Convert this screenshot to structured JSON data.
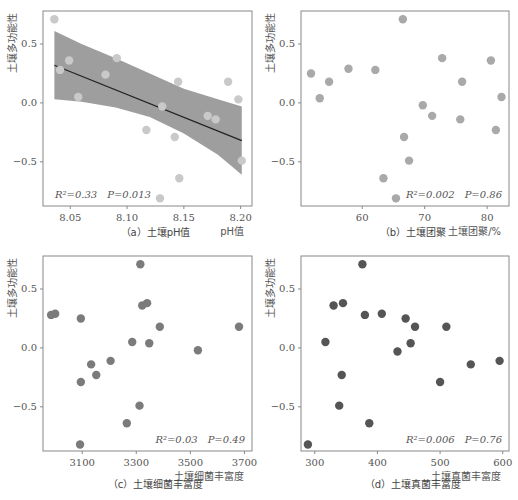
{
  "chart_data": [
    {
      "id": "a",
      "type": "scatter",
      "caption": "（a）土壤pH值",
      "xlabel": "pH值",
      "ylabel": "土壤多功能性",
      "xlim": [
        8.026,
        8.21
      ],
      "ylim": [
        -0.875,
        0.78
      ],
      "xticks": [
        "8.05",
        "8.10",
        "8.15",
        "8.20"
      ],
      "xtick_values": [
        8.05,
        8.1,
        8.15,
        8.2
      ],
      "yticks": [
        "−0.5",
        "0.0",
        "0.5"
      ],
      "ytick_values": [
        -0.5,
        0.0,
        0.5
      ],
      "stats": {
        "r2": "R²=0.33",
        "p": "P=0.013"
      },
      "point_color": "#c9c9c9",
      "regression": {
        "x": [
          8.036,
          8.201
        ],
        "y": [
          0.32,
          -0.32
        ],
        "line_color": "#222222",
        "ci_color": "#999999",
        "ci_upper": [
          [
            8.036,
            0.61
          ],
          [
            8.06,
            0.5
          ],
          [
            8.09,
            0.38
          ],
          [
            8.12,
            0.25
          ],
          [
            8.15,
            0.12
          ],
          [
            8.18,
            0.03
          ],
          [
            8.201,
            -0.03
          ]
        ],
        "ci_lower": [
          [
            8.036,
            0.03
          ],
          [
            8.06,
            0.01
          ],
          [
            8.09,
            -0.04
          ],
          [
            8.12,
            -0.12
          ],
          [
            8.15,
            -0.26
          ],
          [
            8.18,
            -0.44
          ],
          [
            8.201,
            -0.61
          ]
        ]
      },
      "points": [
        {
          "x": 8.036,
          "y": 0.71
        },
        {
          "x": 8.041,
          "y": 0.28
        },
        {
          "x": 8.049,
          "y": 0.36
        },
        {
          "x": 8.057,
          "y": 0.05
        },
        {
          "x": 8.081,
          "y": 0.24
        },
        {
          "x": 8.091,
          "y": 0.38
        },
        {
          "x": 8.117,
          "y": -0.23
        },
        {
          "x": 8.129,
          "y": -0.81
        },
        {
          "x": 8.131,
          "y": -0.03
        },
        {
          "x": 8.142,
          "y": -0.29
        },
        {
          "x": 8.145,
          "y": 0.18
        },
        {
          "x": 8.146,
          "y": -0.64
        },
        {
          "x": 8.171,
          "y": -0.11
        },
        {
          "x": 8.178,
          "y": -0.14
        },
        {
          "x": 8.189,
          "y": 0.18
        },
        {
          "x": 8.198,
          "y": 0.03
        },
        {
          "x": 8.201,
          "y": -0.49
        }
      ]
    },
    {
      "id": "b",
      "type": "scatter",
      "caption": "（b）土壤团聚",
      "xlabel": "土壤团聚/%",
      "ylabel": "土壤多功能性",
      "xlim": [
        50.2,
        83.5
      ],
      "ylim": [
        -0.875,
        0.78
      ],
      "xticks": [
        "60",
        "70",
        "80"
      ],
      "xtick_values": [
        60,
        70,
        80
      ],
      "yticks": [
        "−0.5",
        "0.0",
        "0.5"
      ],
      "ytick_values": [
        -0.5,
        0.0,
        0.5
      ],
      "stats": {
        "r2": "R²=0.002",
        "p": "P=0.86"
      },
      "point_color": "#a9a9a9",
      "points": [
        {
          "x": 51.8,
          "y": 0.25
        },
        {
          "x": 53.2,
          "y": 0.04
        },
        {
          "x": 54.7,
          "y": 0.18
        },
        {
          "x": 57.8,
          "y": 0.29
        },
        {
          "x": 62.1,
          "y": 0.28
        },
        {
          "x": 63.4,
          "y": -0.64
        },
        {
          "x": 65.4,
          "y": -0.81
        },
        {
          "x": 66.5,
          "y": 0.71
        },
        {
          "x": 66.7,
          "y": -0.29
        },
        {
          "x": 67.5,
          "y": -0.49
        },
        {
          "x": 69.7,
          "y": -0.02
        },
        {
          "x": 71.2,
          "y": -0.11
        },
        {
          "x": 72.8,
          "y": 0.38
        },
        {
          "x": 75.7,
          "y": -0.14
        },
        {
          "x": 76.0,
          "y": 0.18
        },
        {
          "x": 80.6,
          "y": 0.36
        },
        {
          "x": 81.4,
          "y": -0.23
        },
        {
          "x": 82.3,
          "y": 0.05
        }
      ]
    },
    {
      "id": "c",
      "type": "scatter",
      "caption": "（c）土壤细菌丰富度",
      "xlabel": "土壤细菌丰富度",
      "ylabel": "土壤多功能性",
      "xlim": [
        2955,
        3728
      ],
      "ylim": [
        -0.875,
        0.78
      ],
      "xticks": [
        "3100",
        "3300",
        "3500",
        "3700"
      ],
      "xtick_values": [
        3100,
        3300,
        3500,
        3700
      ],
      "yticks": [
        "−0.5",
        "0.0",
        "0.5"
      ],
      "ytick_values": [
        -0.5,
        0.0,
        0.5
      ],
      "stats": {
        "r2": "R²=0.03",
        "p": "P=0.49"
      },
      "point_color": "#7b7b7b",
      "points": [
        {
          "x": 2985,
          "y": 0.28
        },
        {
          "x": 3000,
          "y": 0.29
        },
        {
          "x": 3095,
          "y": 0.25
        },
        {
          "x": 3095,
          "y": -0.29
        },
        {
          "x": 3092,
          "y": -0.82
        },
        {
          "x": 3133,
          "y": -0.14
        },
        {
          "x": 3152,
          "y": -0.23
        },
        {
          "x": 3205,
          "y": -0.11
        },
        {
          "x": 3265,
          "y": -0.64
        },
        {
          "x": 3285,
          "y": 0.05
        },
        {
          "x": 3312,
          "y": -0.49
        },
        {
          "x": 3315,
          "y": 0.71
        },
        {
          "x": 3322,
          "y": 0.36
        },
        {
          "x": 3340,
          "y": 0.38
        },
        {
          "x": 3348,
          "y": 0.04
        },
        {
          "x": 3387,
          "y": 0.18
        },
        {
          "x": 3528,
          "y": -0.02
        },
        {
          "x": 3680,
          "y": 0.18
        }
      ]
    },
    {
      "id": "d",
      "type": "scatter",
      "caption": "（d）土壤真菌丰富度",
      "xlabel": "土壤真菌丰富度",
      "ylabel": "土壤多功能性",
      "xlim": [
        278,
        610
      ],
      "ylim": [
        -0.875,
        0.78
      ],
      "xticks": [
        "300",
        "400",
        "500",
        "600"
      ],
      "xtick_values": [
        300,
        400,
        500,
        600
      ],
      "yticks": [
        "−0.5",
        "0.0",
        "0.5"
      ],
      "ytick_values": [
        -0.5,
        0.0,
        0.5
      ],
      "stats": {
        "r2": "R²=0.006",
        "p": "P=0.76"
      },
      "point_color": "#555555",
      "points": [
        {
          "x": 289,
          "y": -0.82
        },
        {
          "x": 317,
          "y": 0.05
        },
        {
          "x": 330,
          "y": 0.36
        },
        {
          "x": 339,
          "y": -0.49
        },
        {
          "x": 343,
          "y": -0.23
        },
        {
          "x": 345,
          "y": 0.38
        },
        {
          "x": 376,
          "y": 0.71
        },
        {
          "x": 380,
          "y": 0.28
        },
        {
          "x": 387,
          "y": -0.64
        },
        {
          "x": 407,
          "y": 0.29
        },
        {
          "x": 432,
          "y": -0.03
        },
        {
          "x": 445,
          "y": 0.25
        },
        {
          "x": 453,
          "y": 0.04
        },
        {
          "x": 460,
          "y": 0.18
        },
        {
          "x": 500,
          "y": -0.29
        },
        {
          "x": 510,
          "y": 0.18
        },
        {
          "x": 549,
          "y": -0.14
        },
        {
          "x": 595,
          "y": -0.11
        }
      ]
    }
  ]
}
